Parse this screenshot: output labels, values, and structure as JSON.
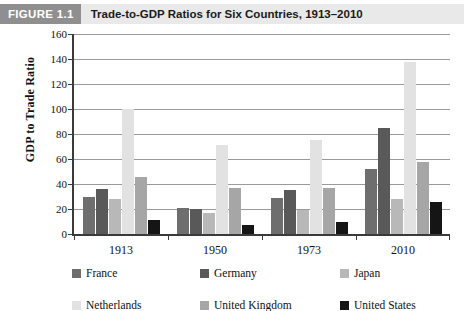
{
  "figure": {
    "badge": "FIGURE 1.1",
    "title": "Trade-to-GDP Ratios for Six Countries, 1913–2010"
  },
  "chart_data": {
    "type": "bar",
    "title": "Trade-to-GDP Ratios for Six Countries, 1913–2010",
    "xlabel": "",
    "ylabel": "GDP to Trade Ratio",
    "ylim": [
      0,
      160
    ],
    "ytick_step": 20,
    "yticks": [
      160,
      140,
      120,
      100,
      80,
      60,
      40,
      20,
      0
    ],
    "grid": "horizontal",
    "legend_position": "bottom",
    "categories": [
      "1913",
      "1950",
      "1973",
      "2010"
    ],
    "series": [
      {
        "name": "France",
        "color": "#6e6e6e",
        "values": [
          30,
          21,
          29,
          52
        ]
      },
      {
        "name": "Germany",
        "color": "#595959",
        "values": [
          36,
          20,
          35,
          85
        ]
      },
      {
        "name": "Japan",
        "color": "#b8b8b8",
        "values": [
          28,
          17,
          19,
          28
        ]
      },
      {
        "name": "Netherlands",
        "color": "#e2e2e2",
        "values": [
          100,
          71,
          75,
          138
        ]
      },
      {
        "name": "United Kingdom",
        "color": "#a6a6a6",
        "values": [
          46,
          37,
          37,
          58
        ]
      },
      {
        "name": "United States",
        "color": "#151515",
        "values": [
          11,
          7,
          10,
          26
        ]
      }
    ]
  },
  "colors": {
    "header_band": "#e9e9e9",
    "badge_background": "#8f8f8f",
    "axis": "#3a3a3a",
    "gridline": "#9a9a9a",
    "plot_background": "#ffffff"
  }
}
